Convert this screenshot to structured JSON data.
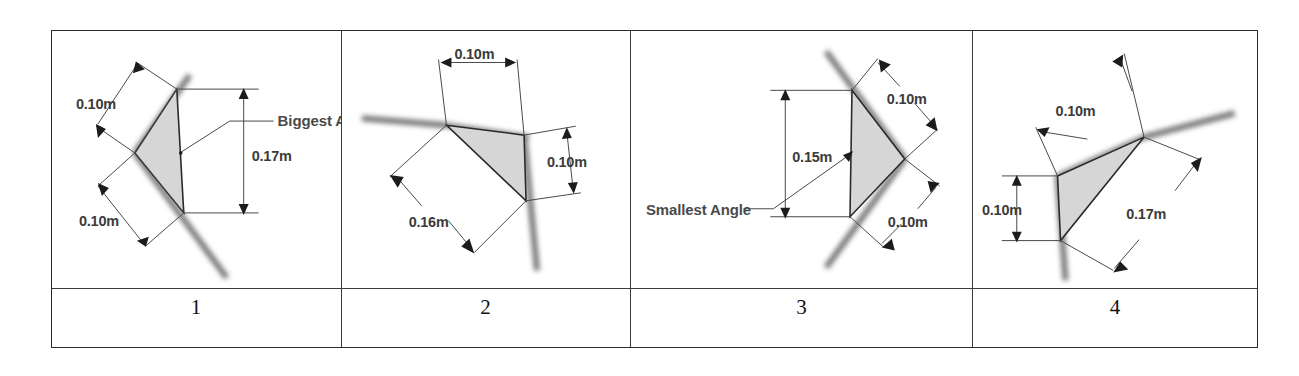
{
  "table": {
    "columns": [
      {
        "number": "1",
        "figure": {
          "name": "wedge-triangle-left-apex",
          "fill_color": "#d6d6d6",
          "wall_color": "#8a8a8a",
          "labels": [
            {
              "text": "0.10m",
              "role": "upper-left-dimension"
            },
            {
              "text": "0.10m",
              "role": "lower-left-dimension"
            },
            {
              "text": "0.17m",
              "role": "right-vertical-dimension"
            },
            {
              "text": "Biggest Angle",
              "role": "callout-annotation"
            }
          ]
        }
      },
      {
        "number": "2",
        "figure": {
          "name": "corner-triangle-upper-left",
          "fill_color": "#d6d6d6",
          "wall_color": "#8a8a8a",
          "labels": [
            {
              "text": "0.10m",
              "role": "top-dimension"
            },
            {
              "text": "0.10m",
              "role": "right-dimension"
            },
            {
              "text": "0.16m",
              "role": "diagonal-dimension"
            }
          ]
        }
      },
      {
        "number": "3",
        "figure": {
          "name": "wedge-triangle-right-apex",
          "fill_color": "#d6d6d6",
          "wall_color": "#8a8a8a",
          "labels": [
            {
              "text": "0.15m",
              "role": "left-vertical-dimension"
            },
            {
              "text": "0.10m",
              "role": "upper-right-dimension"
            },
            {
              "text": "0.10m",
              "role": "lower-right-dimension"
            },
            {
              "text": "Smallest Angle",
              "role": "callout-annotation"
            }
          ]
        }
      },
      {
        "number": "4",
        "figure": {
          "name": "corner-triangle-tilted",
          "fill_color": "#d6d6d6",
          "wall_color": "#8a8a8a",
          "labels": [
            {
              "text": "0.10m",
              "role": "upper-left-dimension"
            },
            {
              "text": "0.10m",
              "role": "left-vertical-dimension"
            },
            {
              "text": "0.17m",
              "role": "diagonal-dimension"
            }
          ]
        }
      }
    ]
  }
}
